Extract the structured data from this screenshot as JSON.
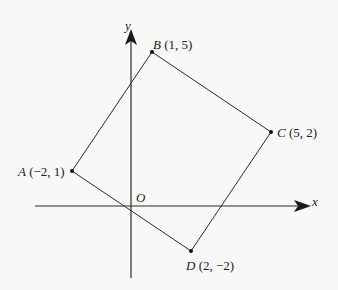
{
  "diagram": {
    "type": "coordinate-quadrilateral",
    "colors": {
      "background": "#f8f8f7",
      "stroke": "#2a2a2a",
      "text": "#222222"
    },
    "axes": {
      "x_label": "x",
      "y_label": "y",
      "origin_label": "O"
    },
    "points": [
      {
        "name": "A",
        "coords": "(−2, 1)",
        "x": -2,
        "y": 1
      },
      {
        "name": "B",
        "coords": "(1, 5)",
        "x": 1,
        "y": 5
      },
      {
        "name": "C",
        "coords": "(5, 2)",
        "x": 5,
        "y": 2
      },
      {
        "name": "D",
        "coords": "(2, −2)",
        "x": 2,
        "y": -2
      }
    ],
    "edges": [
      "AB",
      "BC",
      "CD",
      "DA"
    ]
  }
}
